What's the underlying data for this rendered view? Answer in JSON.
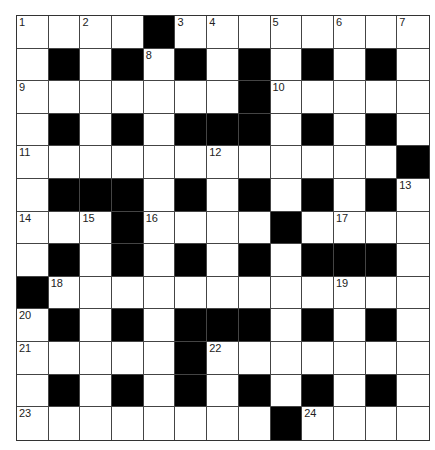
{
  "puzzle": {
    "type": "crossword",
    "rows": 13,
    "cols": 13,
    "colors": {
      "block": "#000000",
      "cell": "#ffffff",
      "line": "#444444"
    },
    "layout": [
      "....#........",
      ".#.#.#.#.#.#.",
      ".......#.....",
      ".#.#.###.#.#.",
      "............#",
      ".###.#.#.#.#.",
      "...#....#....",
      ".#.#.#.#.###.",
      "#............",
      ".#.#.###.#.#.",
      ".....#.......",
      ".#.#.#.#.#.#.",
      "........#...."
    ],
    "numbers": [
      {
        "r": 0,
        "c": 0,
        "n": "1"
      },
      {
        "r": 0,
        "c": 2,
        "n": "2"
      },
      {
        "r": 0,
        "c": 5,
        "n": "3"
      },
      {
        "r": 0,
        "c": 6,
        "n": "4"
      },
      {
        "r": 0,
        "c": 8,
        "n": "5"
      },
      {
        "r": 0,
        "c": 10,
        "n": "6"
      },
      {
        "r": 0,
        "c": 12,
        "n": "7"
      },
      {
        "r": 1,
        "c": 4,
        "n": "8"
      },
      {
        "r": 2,
        "c": 0,
        "n": "9"
      },
      {
        "r": 2,
        "c": 8,
        "n": "10"
      },
      {
        "r": 4,
        "c": 0,
        "n": "11"
      },
      {
        "r": 4,
        "c": 6,
        "n": "12"
      },
      {
        "r": 5,
        "c": 12,
        "n": "13"
      },
      {
        "r": 6,
        "c": 0,
        "n": "14"
      },
      {
        "r": 6,
        "c": 2,
        "n": "15"
      },
      {
        "r": 6,
        "c": 4,
        "n": "16"
      },
      {
        "r": 6,
        "c": 10,
        "n": "17"
      },
      {
        "r": 8,
        "c": 1,
        "n": "18"
      },
      {
        "r": 8,
        "c": 10,
        "n": "19"
      },
      {
        "r": 9,
        "c": 0,
        "n": "20"
      },
      {
        "r": 10,
        "c": 0,
        "n": "21"
      },
      {
        "r": 10,
        "c": 6,
        "n": "22"
      },
      {
        "r": 12,
        "c": 0,
        "n": "23"
      },
      {
        "r": 12,
        "c": 9,
        "n": "24"
      }
    ]
  }
}
